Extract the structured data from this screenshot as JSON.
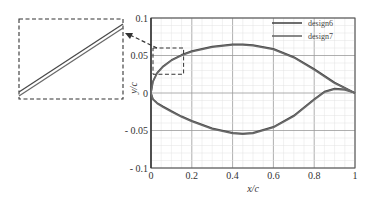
{
  "chart_data": {
    "type": "line",
    "title": "",
    "xlabel": "x/c",
    "ylabel": "y/c",
    "xlim": [
      0,
      1
    ],
    "ylim": [
      -0.1,
      0.1
    ],
    "grid": true,
    "legend_position": "upper right",
    "x_ticks": [
      "0",
      "0.2",
      "0.4",
      "0.6",
      "0.8",
      "1"
    ],
    "y_ticks": [
      "0.1",
      "0.05",
      "0",
      "- 0.05",
      "- 0.1"
    ],
    "series": [
      {
        "name": "design6",
        "upper": {
          "x": [
            0,
            0.01,
            0.03,
            0.06,
            0.1,
            0.15,
            0.2,
            0.3,
            0.4,
            0.45,
            0.5,
            0.6,
            0.7,
            0.8,
            0.9,
            1.0
          ],
          "y": [
            0,
            0.016,
            0.027,
            0.036,
            0.044,
            0.051,
            0.056,
            0.062,
            0.065,
            0.065,
            0.064,
            0.059,
            0.048,
            0.032,
            0.014,
            0
          ]
        },
        "lower": {
          "x": [
            0,
            0.01,
            0.03,
            0.06,
            0.1,
            0.15,
            0.2,
            0.3,
            0.4,
            0.45,
            0.5,
            0.6,
            0.7,
            0.8,
            0.85,
            0.9,
            0.95,
            1.0
          ],
          "y": [
            0,
            -0.008,
            -0.013,
            -0.018,
            -0.024,
            -0.031,
            -0.037,
            -0.047,
            -0.053,
            -0.054,
            -0.053,
            -0.045,
            -0.03,
            -0.008,
            0.002,
            0.006,
            0.005,
            0
          ]
        }
      },
      {
        "name": "design7",
        "upper": {
          "x": [
            0,
            0.01,
            0.03,
            0.06,
            0.1,
            0.15,
            0.2,
            0.3,
            0.4,
            0.45,
            0.5,
            0.6,
            0.7,
            0.8,
            0.9,
            1.0
          ],
          "y": [
            0,
            0.015,
            0.026,
            0.035,
            0.043,
            0.05,
            0.055,
            0.061,
            0.064,
            0.064,
            0.063,
            0.058,
            0.047,
            0.031,
            0.013,
            0
          ]
        },
        "lower": {
          "x": [
            0,
            0.01,
            0.03,
            0.06,
            0.1,
            0.15,
            0.2,
            0.3,
            0.4,
            0.45,
            0.5,
            0.6,
            0.7,
            0.8,
            0.85,
            0.9,
            0.95,
            1.0
          ],
          "y": [
            0,
            -0.009,
            -0.014,
            -0.019,
            -0.025,
            -0.032,
            -0.038,
            -0.048,
            -0.054,
            -0.055,
            -0.054,
            -0.046,
            -0.031,
            -0.009,
            0.001,
            0.005,
            0.004,
            0
          ]
        }
      }
    ],
    "annotations": {
      "zoom_box": {
        "x": [
          0,
          0.15
        ],
        "y": [
          0.025,
          0.06
        ]
      },
      "inset": "magnified view of leading-edge upper surface"
    }
  }
}
